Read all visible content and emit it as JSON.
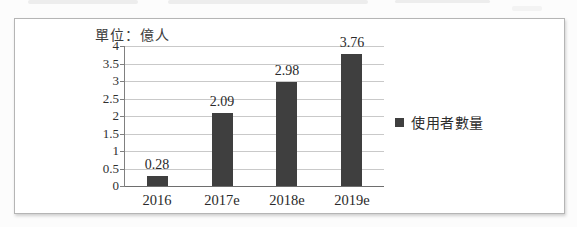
{
  "chart_data": {
    "type": "bar",
    "unit_label": "單位：億人",
    "categories": [
      "2016",
      "2017e",
      "2018e",
      "2019e"
    ],
    "series": [
      {
        "name": "使用者數量",
        "values": [
          0.28,
          2.09,
          2.98,
          3.76
        ]
      }
    ],
    "value_labels": [
      "0.28",
      "2.09",
      "2.98",
      "3.76"
    ],
    "ylim": [
      0,
      4
    ],
    "ytick_step": 0.5,
    "ytick_labels": [
      "0",
      "0.5",
      "1",
      "1.5",
      "2",
      "2.5",
      "3",
      "3.5",
      "4"
    ],
    "grid": true,
    "legend": {
      "position": "right",
      "entries": [
        {
          "label": "使用者數量",
          "marker_color": "#3f3f3f"
        }
      ]
    },
    "colors": {
      "bar": "#3f3f3f",
      "gridline": "#c9c9c9",
      "baseline": "#6e6e6e",
      "axis": "#808080",
      "text": "#2f2f2f"
    }
  }
}
